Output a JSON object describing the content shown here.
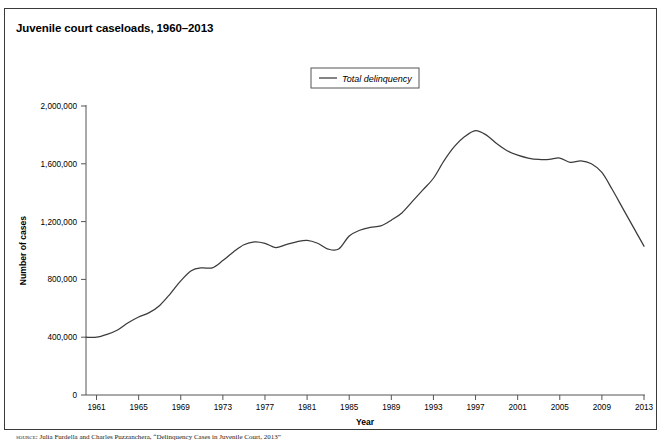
{
  "figure": {
    "title": "Juvenile court caseloads, 1960–2013",
    "source_label": "source:",
    "source_text": "Julia Furdella and Charles Puzzanchera, “Delinquency Cases in Juvenile Court, 2013”"
  },
  "colors": {
    "line": "#3b3b3b",
    "axis": "#555555",
    "frame": "#3a3a3a",
    "background": "#ffffff"
  },
  "legend": {
    "position": "top-center",
    "entries": [
      {
        "label": "Total delinquency",
        "color": "#3b3b3b",
        "marker": "line"
      }
    ]
  },
  "chart_data": {
    "type": "line",
    "title": "Juvenile court caseloads, 1960–2013",
    "xlabel": "Year",
    "ylabel": "Number of cases",
    "xlim": [
      1960,
      2013
    ],
    "ylim": [
      0,
      2000000
    ],
    "grid": false,
    "xticks": [
      1961,
      1965,
      1969,
      1973,
      1977,
      1981,
      1985,
      1989,
      1993,
      1997,
      2001,
      2005,
      2009,
      2013
    ],
    "xtick_labels": [
      "1961",
      "1965",
      "1969",
      "1973",
      "1977",
      "1981",
      "1985",
      "1989",
      "1993",
      "1997",
      "2001",
      "2005",
      "2009",
      "2013"
    ],
    "yticks": [
      0,
      400000,
      800000,
      1200000,
      1600000,
      2000000
    ],
    "ytick_labels": [
      "0",
      "400,000",
      "800,000",
      "1,200,000",
      "1,600,000",
      "2,000,000"
    ],
    "series": [
      {
        "name": "Total delinquency",
        "color": "#3b3b3b",
        "x": [
          1960,
          1961,
          1962,
          1963,
          1964,
          1965,
          1966,
          1967,
          1968,
          1969,
          1970,
          1971,
          1972,
          1973,
          1974,
          1975,
          1976,
          1977,
          1978,
          1979,
          1980,
          1981,
          1982,
          1983,
          1984,
          1985,
          1986,
          1987,
          1988,
          1989,
          1990,
          1991,
          1992,
          1993,
          1994,
          1995,
          1996,
          1997,
          1998,
          1999,
          2000,
          2001,
          2002,
          2003,
          2004,
          2005,
          2006,
          2007,
          2008,
          2009,
          2010,
          2011,
          2012,
          2013
        ],
        "values": [
          400000,
          400000,
          420000,
          450000,
          500000,
          540000,
          570000,
          620000,
          700000,
          790000,
          860000,
          880000,
          880000,
          930000,
          990000,
          1040000,
          1060000,
          1050000,
          1020000,
          1040000,
          1060000,
          1070000,
          1050000,
          1010000,
          1010000,
          1100000,
          1140000,
          1160000,
          1170000,
          1210000,
          1260000,
          1340000,
          1420000,
          1500000,
          1620000,
          1720000,
          1790000,
          1830000,
          1800000,
          1740000,
          1690000,
          1660000,
          1640000,
          1630000,
          1630000,
          1640000,
          1610000,
          1620000,
          1600000,
          1540000,
          1420000,
          1290000,
          1160000,
          1030000
        ]
      }
    ]
  }
}
